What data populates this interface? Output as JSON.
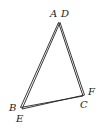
{
  "diagram": {
    "type": "geometry",
    "triangles": [
      {
        "name": "ABC",
        "vertices": {
          "A": {
            "x": 58.5,
            "y": 22.5
          },
          "B": {
            "x": 20.5,
            "y": 107.5
          },
          "C": {
            "x": 83,
            "y": 96
          }
        }
      },
      {
        "name": "DEF",
        "vertices": {
          "D": {
            "x": 60,
            "y": 22.5
          },
          "E": {
            "x": 22,
            "y": 109
          },
          "F": {
            "x": 84.5,
            "y": 95
          }
        }
      }
    ],
    "labels": {
      "A": "A",
      "B": "B",
      "C": "C",
      "D": "D",
      "E": "E",
      "F": "F"
    },
    "stroke_color": "#222222",
    "background": "#ffffff"
  }
}
